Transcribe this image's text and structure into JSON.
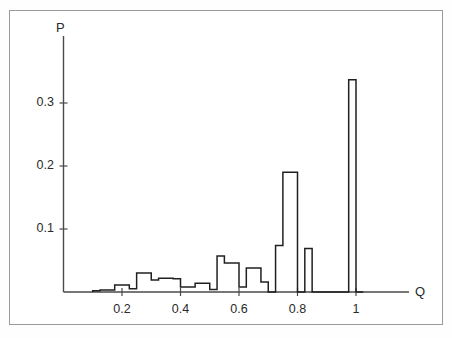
{
  "chart_data": {
    "type": "bar",
    "title": "",
    "subtitle": "",
    "xlabel": "Q",
    "ylabel": "P",
    "xlim": [
      0.0,
      1.08
    ],
    "ylim": [
      0.0,
      0.375
    ],
    "grid": false,
    "legend": null,
    "annotations": [],
    "xticks": [
      0.2,
      0.4,
      0.6,
      0.8,
      1.0
    ],
    "xticklabels": [
      "0.2",
      "0.4",
      "0.6",
      "0.8",
      "1"
    ],
    "yticks": [
      0.1,
      0.2,
      0.3
    ],
    "yticklabels": [
      "0.1",
      "0.2",
      "0.3"
    ],
    "bin_width": 0.025,
    "histogram_style": "step-outline",
    "bins": [
      {
        "x0": 0.1,
        "x1": 0.125,
        "value": 0.002
      },
      {
        "x0": 0.125,
        "x1": 0.15,
        "value": 0.003
      },
      {
        "x0": 0.15,
        "x1": 0.175,
        "value": 0.003
      },
      {
        "x0": 0.175,
        "x1": 0.2,
        "value": 0.011
      },
      {
        "x0": 0.2,
        "x1": 0.225,
        "value": 0.011
      },
      {
        "x0": 0.225,
        "x1": 0.25,
        "value": 0.005
      },
      {
        "x0": 0.25,
        "x1": 0.275,
        "value": 0.03
      },
      {
        "x0": 0.275,
        "x1": 0.3,
        "value": 0.03
      },
      {
        "x0": 0.3,
        "x1": 0.325,
        "value": 0.019
      },
      {
        "x0": 0.325,
        "x1": 0.35,
        "value": 0.022
      },
      {
        "x0": 0.35,
        "x1": 0.375,
        "value": 0.022
      },
      {
        "x0": 0.375,
        "x1": 0.4,
        "value": 0.021
      },
      {
        "x0": 0.4,
        "x1": 0.425,
        "value": 0.008
      },
      {
        "x0": 0.425,
        "x1": 0.45,
        "value": 0.008
      },
      {
        "x0": 0.45,
        "x1": 0.475,
        "value": 0.014
      },
      {
        "x0": 0.475,
        "x1": 0.5,
        "value": 0.014
      },
      {
        "x0": 0.5,
        "x1": 0.525,
        "value": 0.004
      },
      {
        "x0": 0.525,
        "x1": 0.55,
        "value": 0.057
      },
      {
        "x0": 0.55,
        "x1": 0.575,
        "value": 0.046
      },
      {
        "x0": 0.575,
        "x1": 0.6,
        "value": 0.046
      },
      {
        "x0": 0.6,
        "x1": 0.625,
        "value": 0.008
      },
      {
        "x0": 0.625,
        "x1": 0.65,
        "value": 0.038
      },
      {
        "x0": 0.65,
        "x1": 0.675,
        "value": 0.038
      },
      {
        "x0": 0.675,
        "x1": 0.7,
        "value": 0.016
      },
      {
        "x0": 0.7,
        "x1": 0.725,
        "value": 0.0
      },
      {
        "x0": 0.725,
        "x1": 0.75,
        "value": 0.074
      },
      {
        "x0": 0.75,
        "x1": 0.775,
        "value": 0.19
      },
      {
        "x0": 0.775,
        "x1": 0.8,
        "value": 0.19
      },
      {
        "x0": 0.8,
        "x1": 0.825,
        "value": 0.0
      },
      {
        "x0": 0.825,
        "x1": 0.85,
        "value": 0.069
      },
      {
        "x0": 0.85,
        "x1": 0.875,
        "value": 0.0
      },
      {
        "x0": 0.875,
        "x1": 0.9,
        "value": 0.0
      },
      {
        "x0": 0.9,
        "x1": 0.925,
        "value": 0.0
      },
      {
        "x0": 0.925,
        "x1": 0.95,
        "value": 0.0
      },
      {
        "x0": 0.95,
        "x1": 0.975,
        "value": 0.0
      },
      {
        "x0": 0.975,
        "x1": 1.0,
        "value": 0.337
      },
      {
        "x0": 1.0,
        "x1": 1.025,
        "value": 0.0
      }
    ]
  },
  "axes": {
    "y_axis_label": "P",
    "x_axis_label": "Q",
    "x_tick_labels": [
      "0.2",
      "0.4",
      "0.6",
      "0.8",
      "1"
    ],
    "y_tick_labels": [
      "0.3",
      "0.2",
      "0.1"
    ]
  },
  "colors": {
    "line": "#202020",
    "axis": "#505050",
    "frame": "#9a9a9a",
    "background": "#ffffff",
    "text": "#2a2a2a"
  }
}
